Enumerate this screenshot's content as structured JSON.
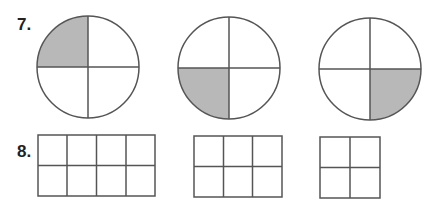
{
  "problems": [
    {
      "number": "7.",
      "type": "circles",
      "shapes": [
        {
          "parts": 4,
          "shaded_quadrant": "top-left"
        },
        {
          "parts": 4,
          "shaded_quadrant": "bottom-left"
        },
        {
          "parts": 4,
          "shaded_quadrant": "bottom-right"
        }
      ]
    },
    {
      "number": "8.",
      "type": "grids",
      "shapes": [
        {
          "cols": 4,
          "rows": 2,
          "shaded": 0
        },
        {
          "cols": 3,
          "rows": 2,
          "shaded": 0
        },
        {
          "cols": 2,
          "rows": 2,
          "shaded": 0
        }
      ]
    }
  ],
  "colors": {
    "stroke": "#555555",
    "shade": "#b8b8b8"
  }
}
